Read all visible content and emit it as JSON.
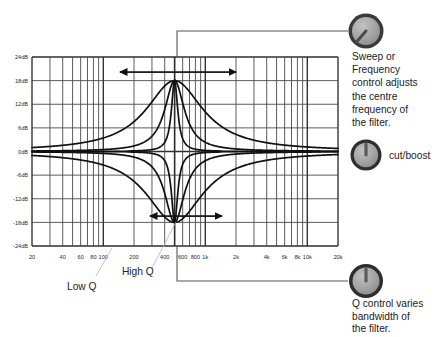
{
  "figure": {
    "title_alt": "Parametric EQ filter response diagram"
  },
  "chart_data": {
    "type": "line",
    "title": "",
    "xlabel": "",
    "ylabel": "",
    "xscale": "log",
    "xlim": [
      20,
      20000
    ],
    "ylim": [
      -24,
      24
    ],
    "grid": true,
    "legend": "none",
    "y_ticks": [
      "24dB",
      "18dB",
      "12dB",
      "6dB",
      "0dB",
      "-6dB",
      "-12dB",
      "-18dB",
      "-24dB"
    ],
    "y_tick_values": [
      24,
      18,
      12,
      6,
      0,
      -6,
      -12,
      -18,
      -24
    ],
    "x_ticks": [
      "20",
      "40",
      "60",
      "80",
      "100",
      "200",
      "400",
      "600",
      "800",
      "1k",
      "2k",
      "4k",
      "6k",
      "8k",
      "10k",
      "20k"
    ],
    "x_tick_values": [
      20,
      40,
      60,
      80,
      100,
      200,
      400,
      600,
      800,
      1000,
      2000,
      4000,
      6000,
      8000,
      10000,
      20000
    ],
    "centre_frequency_hz": 500,
    "peak_gain_db": 18,
    "dip_gain_db": -18,
    "series": [
      {
        "name": "Boost - Low Q",
        "type": "peak",
        "centre_hz": 500,
        "gain_db": 18,
        "q": 0.55
      },
      {
        "name": "Boost - Medium Q",
        "type": "peak",
        "centre_hz": 500,
        "gain_db": 18,
        "q": 1.6
      },
      {
        "name": "Boost - High Q",
        "type": "peak",
        "centre_hz": 500,
        "gain_db": 18,
        "q": 5.0
      },
      {
        "name": "Cut - Low Q",
        "type": "notch",
        "centre_hz": 500,
        "gain_db": -18,
        "q": 0.55
      },
      {
        "name": "Cut - Medium Q",
        "type": "notch",
        "centre_hz": 500,
        "gain_db": -18,
        "q": 1.6
      },
      {
        "name": "Cut - High Q",
        "type": "notch",
        "centre_hz": 500,
        "gain_db": -18,
        "q": 5.0
      }
    ],
    "annotations": [
      {
        "name": "frequency-sweep-arrow",
        "label": "",
        "kind": "double-arrow-horizontal",
        "at_db": 21
      },
      {
        "name": "bandwidth-arrow",
        "label": "",
        "kind": "double-arrow-horizontal",
        "at_db": -12
      }
    ]
  },
  "graph_labels": {
    "low_q": "Low Q",
    "high_q": "High Q"
  },
  "annotations": {
    "sweep": {
      "knob_name": "sweep-frequency-knob",
      "lines": [
        "Sweep or",
        "Frequency",
        "control adjusts",
        "the centre",
        "frequency of",
        "the filter."
      ]
    },
    "cut_boost": {
      "knob_name": "cut-boost-knob",
      "label": "cut/boost"
    },
    "q": {
      "knob_name": "q-knob",
      "lines": [
        "Q control varies",
        "bandwidth of",
        "the filter."
      ]
    }
  },
  "colors": {
    "grid": "#4a4a4a",
    "grid_strong": "#2e2e2e",
    "curve": "#111111",
    "knob_outer": "#3a3a3a",
    "knob_face": "#9e9e9e",
    "text": "#232323",
    "connector": "#555555",
    "background": "#ffffff"
  }
}
